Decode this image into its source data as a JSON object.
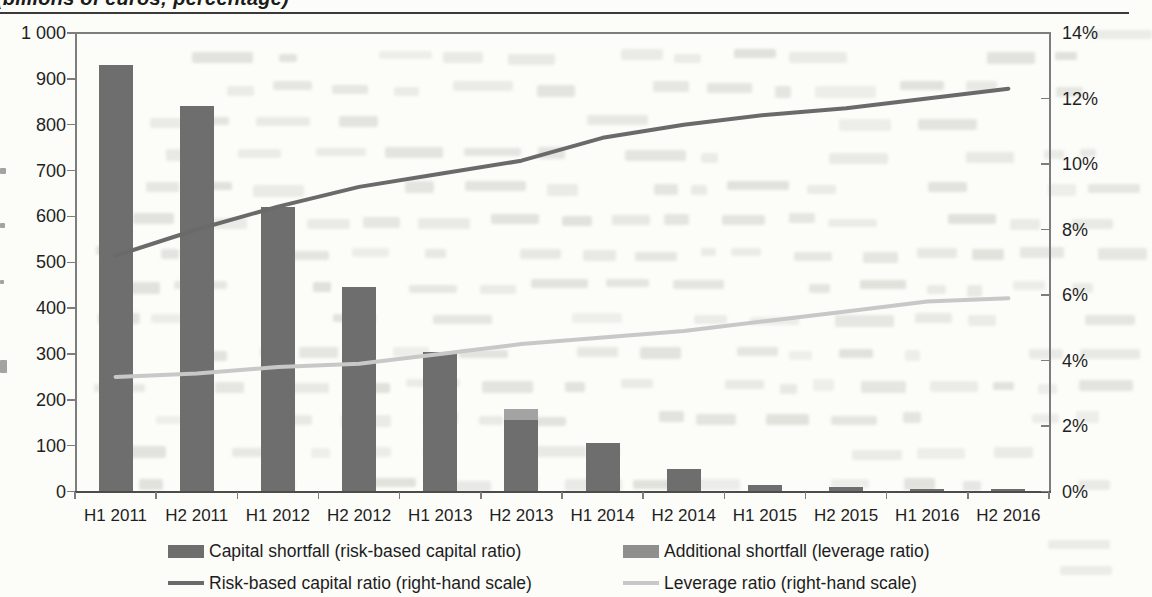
{
  "page": {
    "title_fragment": "(billions of euros; percentage)"
  },
  "chart_data": {
    "type": "bar",
    "subtype": "stacked-bar with overlaid lines (combo chart, dual axis)",
    "title": "(billions of euros; percentage)",
    "xlabel": "",
    "ylabel": "",
    "grid": false,
    "legend_position": "bottom",
    "categories": [
      "H1 2011",
      "H2 2011",
      "H1 2012",
      "H2 2012",
      "H1 2013",
      "H2 2013",
      "H1 2014",
      "H2 2014",
      "H1 2015",
      "H2 2015",
      "H1 2016",
      "H2 2016"
    ],
    "series": [
      {
        "name": "Capital shortfall (risk-based capital ratio)",
        "type": "bar",
        "axis": "left",
        "color": "#6e6e6e",
        "values": [
          930,
          840,
          620,
          445,
          305,
          155,
          105,
          50,
          15,
          10,
          5,
          5
        ]
      },
      {
        "name": "Additional shortfall (leverage ratio)",
        "type": "bar",
        "stacked_on": "Capital shortfall (risk-based capital ratio)",
        "axis": "left",
        "color": "#a3a3a3",
        "values": [
          0,
          0,
          0,
          0,
          0,
          25,
          0,
          0,
          0,
          0,
          0,
          0
        ]
      },
      {
        "name": "Risk-based capital ratio (right-hand scale)",
        "type": "line",
        "axis": "right",
        "color": "#6a6a6a",
        "values": [
          7.2,
          8.0,
          8.7,
          9.3,
          9.7,
          10.1,
          10.8,
          11.2,
          11.5,
          11.7,
          12.0,
          12.3
        ]
      },
      {
        "name": "Leverage ratio (right-hand scale)",
        "type": "line",
        "axis": "right",
        "color": "#c8c8c8",
        "values": [
          3.5,
          3.6,
          3.8,
          3.9,
          4.2,
          4.5,
          4.7,
          4.9,
          5.2,
          5.5,
          5.8,
          5.9
        ]
      }
    ],
    "left_axis": {
      "min": 0,
      "max": 1000,
      "step": 100,
      "tick_labels": [
        "1 000",
        "900",
        "800",
        "700",
        "600",
        "500",
        "400",
        "300",
        "200",
        "100",
        "0"
      ]
    },
    "right_axis": {
      "min": 0,
      "max": 14,
      "step": 2,
      "tick_labels": [
        "14%",
        "12%",
        "10%",
        "8%",
        "6%",
        "4%",
        "2%",
        "0%"
      ]
    },
    "legend": [
      {
        "label": "Capital shortfall (risk-based capital ratio)",
        "swatch": "bar",
        "color": "#6e6e6e"
      },
      {
        "label": "Additional shortfall (leverage ratio)",
        "swatch": "bar",
        "color": "#8f8f8f"
      },
      {
        "label": "Risk-based capital ratio (right-hand scale)",
        "swatch": "line",
        "color": "#6a6a6a"
      },
      {
        "label": "Leverage ratio (right-hand scale)",
        "swatch": "line",
        "color": "#c8c8c8"
      }
    ]
  }
}
